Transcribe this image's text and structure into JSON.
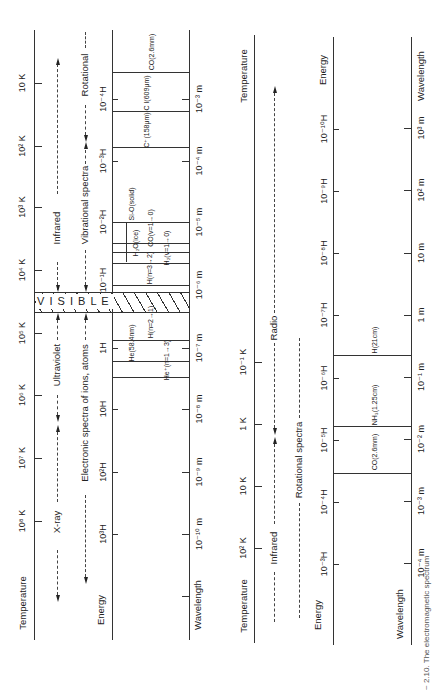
{
  "diagram_title": "The electromagnetic spectrum",
  "caption_fragment": "~ 2.10. The electromagnetic spectrum",
  "high_energy_panel": {
    "axes": {
      "temperature": {
        "label": "Temperature",
        "ticks": [
          {
            "label": "10 K",
            "y": 83
          },
          {
            "label": "10² K",
            "y": 146
          },
          {
            "label": "10³ K",
            "y": 207
          },
          {
            "label": "10⁴ K",
            "y": 270
          },
          {
            "label": "10⁵ K",
            "y": 333
          },
          {
            "label": "10⁶ K",
            "y": 395
          },
          {
            "label": "10⁷ K",
            "y": 458
          },
          {
            "label": "10⁸ K",
            "y": 521
          }
        ]
      },
      "energy": {
        "label": "Energy",
        "ticks": [
          {
            "label": "10⁻⁴H",
            "y": 99
          },
          {
            "label": "10⁻³H",
            "y": 161
          },
          {
            "label": "10⁻²H",
            "y": 222
          },
          {
            "label": "10⁻¹H",
            "y": 285
          },
          {
            "label": "1H",
            "y": 348
          },
          {
            "label": "10H",
            "y": 409
          },
          {
            "label": "10²H",
            "y": 472
          },
          {
            "label": "10³H",
            "y": 534
          }
        ]
      },
      "wavelength": {
        "label": "Wavelength",
        "ticks": [
          {
            "label": "10⁻³ m",
            "y": 99
          },
          {
            "label": "10⁻⁴ m",
            "y": 161
          },
          {
            "label": "10⁻⁵ m",
            "y": 222
          },
          {
            "label": "10⁻⁶ m",
            "y": 285
          },
          {
            "label": "10⁻⁷ m",
            "y": 348
          },
          {
            "label": "10⁻⁸ m",
            "y": 409
          },
          {
            "label": "10⁻⁹ m",
            "y": 472
          },
          {
            "label": "10⁻¹⁰ m",
            "y": 534
          }
        ]
      }
    },
    "bands": {
      "infrared": "Infrared",
      "visible": "V I S I B L E",
      "ultraviolet": "Ultraviolet",
      "xray": "X-ray"
    },
    "spectra": {
      "rotational": "Rotational",
      "vibrational": "Vibrational spectra",
      "electronic": "Electronic spectra of ions, atoms"
    },
    "lines": [
      {
        "label": "CO(2.6mm)",
        "y": 72
      },
      {
        "label": "C I(609μm)",
        "y": 111
      },
      {
        "label": "C⁺(158μm)",
        "y": 147
      },
      {
        "label": "Si-O(solid)",
        "y": 222
      },
      {
        "label": "H₂O(ice)",
        "y": 243
      },
      {
        "label": "CO(v=1→0)",
        "y": 243
      },
      {
        "label": "H(n=3→2)",
        "y": 284
      },
      {
        "label": "H₂(v=1→0)",
        "y": 265
      },
      {
        "label": "H(n=2→1)",
        "y": 340
      },
      {
        "label": "He(58.4nm)",
        "y": 360
      },
      {
        "label": "He⁺(n=1→3)",
        "y": 375
      }
    ]
  },
  "low_energy_panel": {
    "axes": {
      "temperature": {
        "label": "Temperature",
        "ticks": [
          {
            "label": "10⁻¹ K",
            "y": 362
          },
          {
            "label": "1 K",
            "y": 424
          },
          {
            "label": "10 K",
            "y": 486
          },
          {
            "label": "10² K",
            "y": 548
          }
        ]
      },
      "energy": {
        "label": "Energy",
        "ticks": [
          {
            "label": "10⁻¹⁰H",
            "y": 129
          },
          {
            "label": "10⁻⁹H",
            "y": 191
          },
          {
            "label": "10⁻⁸H",
            "y": 253
          },
          {
            "label": "10⁻⁷H",
            "y": 315
          },
          {
            "label": "10⁻⁶H",
            "y": 378
          },
          {
            "label": "10⁻⁵H",
            "y": 440
          },
          {
            "label": "10⁻⁴H",
            "y": 502
          },
          {
            "label": "10⁻³H",
            "y": 564
          }
        ]
      },
      "wavelength": {
        "label": "Wavelength",
        "ticks": [
          {
            "label": "10³ m",
            "y": 128
          },
          {
            "label": "10² m",
            "y": 190
          },
          {
            "label": "10 m",
            "y": 253
          },
          {
            "label": "1 m",
            "y": 315
          },
          {
            "label": "10⁻¹ m",
            "y": 377
          },
          {
            "label": "10⁻² m",
            "y": 439
          },
          {
            "label": "10⁻³ m",
            "y": 501
          },
          {
            "label": "10⁻⁴ m",
            "y": 563
          }
        ]
      }
    },
    "bands": {
      "radio": "Radio",
      "infrared": "Infrared"
    },
    "spectra": {
      "rotational": "Rotational spectra"
    },
    "lines": [
      {
        "label": "H(21cm)",
        "y": 355
      },
      {
        "label": "NH₃(1.25cm)",
        "y": 425
      },
      {
        "label": "CO(2.6mm)",
        "y": 473
      }
    ]
  }
}
